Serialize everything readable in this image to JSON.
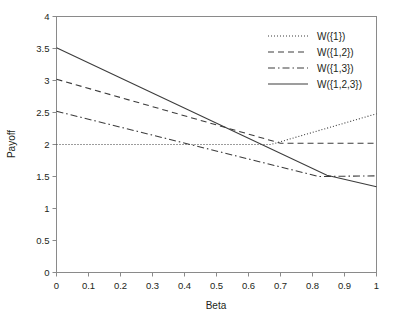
{
  "chart_data": {
    "type": "line",
    "title": "",
    "xlabel": "Beta",
    "ylabel": "Payoff",
    "xlim": [
      0,
      1
    ],
    "ylim": [
      0,
      4
    ],
    "xticks": [
      "0",
      "0.1",
      "0.2",
      "0.3",
      "0.4",
      "0.5",
      "0.6",
      "0.7",
      "0.8",
      "0.9",
      "1"
    ],
    "yticks": [
      "0",
      "0.5",
      "1",
      "1.5",
      "2",
      "2.5",
      "3",
      "3.5",
      "4"
    ],
    "xtick_values": [
      0,
      0.1,
      0.2,
      0.3,
      0.4,
      0.5,
      0.6,
      0.7,
      0.8,
      0.9,
      1
    ],
    "ytick_values": [
      0,
      0.5,
      1,
      1.5,
      2,
      2.5,
      3,
      3.5,
      4
    ],
    "grid": false,
    "legend_position": "top-right",
    "line_color": "#3c3c3c",
    "series": [
      {
        "name": "W({1})",
        "dash": "dotted",
        "dasharray": "1,2",
        "x": [
          0,
          0.67,
          1
        ],
        "values": [
          2.0,
          2.0,
          2.48
        ]
      },
      {
        "name": "W({1,2})",
        "dash": "dashed",
        "dasharray": "6,4",
        "x": [
          0,
          0.7,
          1
        ],
        "values": [
          3.02,
          2.02,
          2.02
        ]
      },
      {
        "name": "W({1,3})",
        "dash": "dash-dot",
        "dasharray": "7,3,1.5,3",
        "x": [
          0,
          0.82,
          1
        ],
        "values": [
          2.52,
          1.5,
          1.51
        ]
      },
      {
        "name": "W({1,2,3})",
        "dash": "solid",
        "dasharray": "none",
        "x": [
          0,
          0.845,
          1
        ],
        "values": [
          3.51,
          1.52,
          1.34
        ]
      }
    ]
  },
  "legend": {
    "items": [
      {
        "label": "W({1})",
        "dasharray": "1,2"
      },
      {
        "label": "W({1,2})",
        "dasharray": "6,4"
      },
      {
        "label": "W({1,3})",
        "dasharray": "7,3,1.5,3"
      },
      {
        "label": "W({1,2,3})",
        "dasharray": "none"
      }
    ]
  }
}
